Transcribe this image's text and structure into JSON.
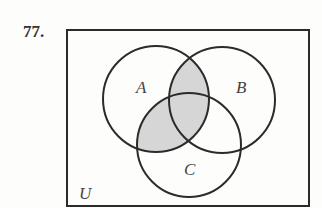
{
  "problem_number": "77.",
  "diagram": {
    "type": "venn",
    "universe_label": "U",
    "sets": [
      {
        "label": "A",
        "cx": 156,
        "cy": 99,
        "r": 53
      },
      {
        "label": "B",
        "cx": 222,
        "cy": 100,
        "r": 53
      },
      {
        "label": "C",
        "cx": 189,
        "cy": 145,
        "r": 52
      }
    ],
    "shaded_regions": [
      "A∩B",
      "A∩C"
    ],
    "shade_color": "#d6d6d6",
    "stroke_color": "#2b2b2b"
  }
}
